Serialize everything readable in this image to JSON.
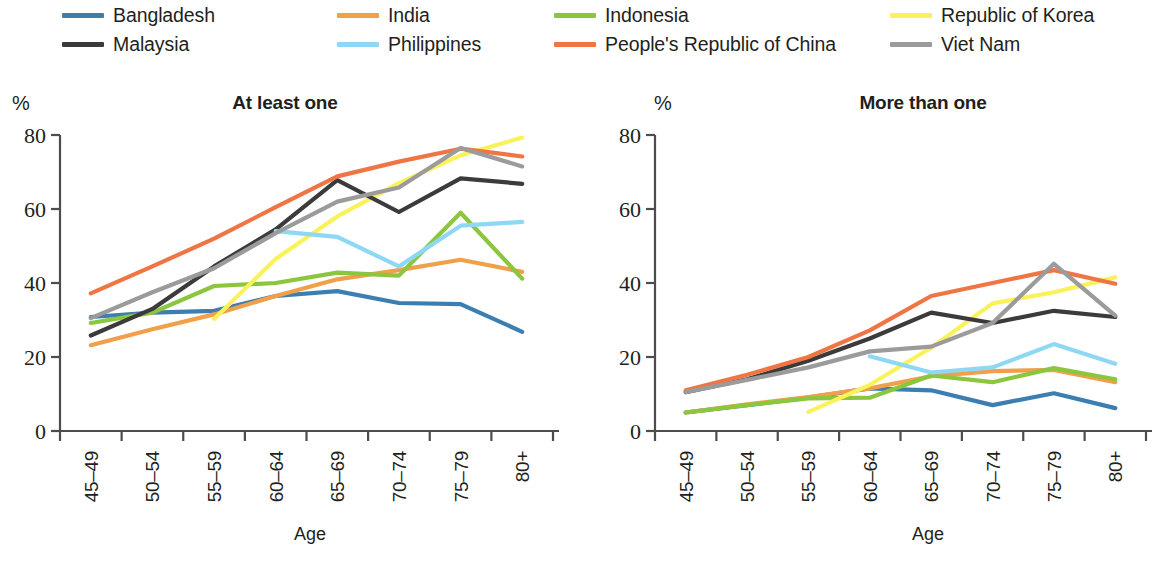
{
  "legend": {
    "items": [
      {
        "label": "Bangladesh",
        "color": "#3d7eb0",
        "col": 0,
        "row": 0
      },
      {
        "label": "India",
        "color": "#f0a04b",
        "col": 1,
        "row": 0
      },
      {
        "label": "Indonesia",
        "color": "#8cc63e",
        "col": 2,
        "row": 0
      },
      {
        "label": "Republic of Korea",
        "color": "#faf25a",
        "col": 3,
        "row": 0
      },
      {
        "label": "Malaysia",
        "color": "#3b3b3b",
        "col": 0,
        "row": 1
      },
      {
        "label": "Philippines",
        "color": "#8ed8f5",
        "col": 1,
        "row": 1
      },
      {
        "label": "People's Republic of China",
        "color": "#f07544",
        "col": 2,
        "row": 1
      },
      {
        "label": "Viet Nam",
        "color": "#9b9b9b",
        "col": 3,
        "row": 1
      }
    ]
  },
  "chart_data": [
    {
      "type": "line",
      "title": "At least one",
      "xlabel": "Age",
      "ylabel": "%",
      "ylim": [
        0,
        80
      ],
      "yticks": [
        0,
        20,
        40,
        60,
        80
      ],
      "grid": false,
      "legend_position": "top",
      "categories": [
        "45–49",
        "50–54",
        "55–59",
        "60–64",
        "65–69",
        "70–74",
        "75–79",
        "80+"
      ],
      "series": [
        {
          "name": "Bangladesh",
          "color": "#3d7eb0",
          "values": [
            30.8,
            32.0,
            32.5,
            36.5,
            37.8,
            34.6,
            34.3,
            26.8
          ]
        },
        {
          "name": "India",
          "color": "#f0a04b",
          "values": [
            23.2,
            27.5,
            31.5,
            36.5,
            41.0,
            43.5,
            46.3,
            43.0
          ]
        },
        {
          "name": "Indonesia",
          "color": "#8cc63e",
          "values": [
            29.2,
            32.0,
            39.2,
            40.0,
            42.8,
            42.0,
            59.0,
            41.2
          ]
        },
        {
          "name": "Republic of Korea",
          "color": "#faf25a",
          "values": [
            null,
            null,
            30.3,
            46.5,
            58.0,
            67.0,
            74.5,
            79.3
          ]
        },
        {
          "name": "Malaysia",
          "color": "#3b3b3b",
          "values": [
            25.8,
            33.0,
            44.5,
            54.5,
            67.8,
            59.2,
            68.3,
            66.8
          ]
        },
        {
          "name": "Philippines",
          "color": "#8ed8f5",
          "values": [
            null,
            null,
            null,
            54.0,
            52.5,
            44.5,
            55.5,
            56.5
          ]
        },
        {
          "name": "People's Republic of China",
          "color": "#f07544",
          "values": [
            37.2,
            44.5,
            52.0,
            60.5,
            68.8,
            72.8,
            76.3,
            74.2
          ]
        },
        {
          "name": "Viet Nam",
          "color": "#9b9b9b",
          "values": [
            30.5,
            37.5,
            44.0,
            53.5,
            62.0,
            65.8,
            76.5,
            71.5
          ]
        }
      ]
    },
    {
      "type": "line",
      "title": "More than one",
      "xlabel": "Age",
      "ylabel": "%",
      "ylim": [
        0,
        80
      ],
      "yticks": [
        0,
        20,
        40,
        60,
        80
      ],
      "grid": false,
      "legend_position": "top",
      "categories": [
        "45–49",
        "50–54",
        "55–59",
        "60–64",
        "65–69",
        "70–74",
        "75–79",
        "80+"
      ],
      "series": [
        {
          "name": "Bangladesh",
          "color": "#3d7eb0",
          "values": [
            5.0,
            7.0,
            9.0,
            11.5,
            11.0,
            7.0,
            10.2,
            6.2
          ]
        },
        {
          "name": "India",
          "color": "#f0a04b",
          "values": [
            5.0,
            7.2,
            9.2,
            11.5,
            14.8,
            16.2,
            16.5,
            13.2
          ]
        },
        {
          "name": "Indonesia",
          "color": "#8cc63e",
          "values": [
            5.0,
            7.0,
            8.8,
            9.0,
            15.0,
            13.2,
            17.0,
            14.0
          ]
        },
        {
          "name": "Republic of Korea",
          "color": "#faf25a",
          "values": [
            null,
            null,
            5.2,
            12.5,
            22.5,
            34.5,
            37.5,
            41.5
          ]
        },
        {
          "name": "Malaysia",
          "color": "#3b3b3b",
          "values": [
            10.5,
            14.0,
            19.0,
            25.0,
            32.0,
            29.2,
            32.5,
            30.8
          ]
        },
        {
          "name": "Philippines",
          "color": "#8ed8f5",
          "values": [
            null,
            null,
            null,
            20.2,
            15.8,
            17.2,
            23.5,
            18.2
          ]
        },
        {
          "name": "People's Republic of China",
          "color": "#f07544",
          "values": [
            11.0,
            15.2,
            20.0,
            27.2,
            36.5,
            40.0,
            43.5,
            39.8
          ]
        },
        {
          "name": "Viet Nam",
          "color": "#9b9b9b",
          "values": [
            10.5,
            13.8,
            17.2,
            21.5,
            22.8,
            29.2,
            45.2,
            31.2
          ]
        }
      ]
    }
  ]
}
